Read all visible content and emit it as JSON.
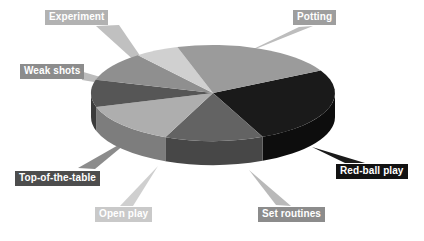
{
  "chart_data": {
    "type": "pie",
    "title": "",
    "subtitle": "",
    "xlabel": "",
    "ylabel": "",
    "legend_position": "callout-labels",
    "grid": false,
    "three_d": true,
    "categories": [
      "Red-ball play",
      "Set routines",
      "Open play",
      "Top-of-the-table",
      "Weak shots",
      "Experiment",
      "Potting"
    ],
    "values": [
      26,
      13,
      14,
      9,
      10,
      6,
      22
    ],
    "slices": [
      {
        "label": "Red-ball play",
        "value": 26,
        "color": "#1a1a1a",
        "side_color": "#0d0d0d",
        "start_angle": -28,
        "end_angle": 66
      },
      {
        "label": "Set routines",
        "value": 13,
        "color": "#636363",
        "side_color": "#474747",
        "start_angle": 66,
        "end_angle": 113
      },
      {
        "label": "Open play",
        "value": 14,
        "color": "#aeaeae",
        "side_color": "#7d7d7d",
        "start_angle": 113,
        "end_angle": 163
      },
      {
        "label": "Top-of-the-table",
        "value": 9,
        "color": "#565656",
        "side_color": "#3b3b3b",
        "start_angle": 163,
        "end_angle": 196
      },
      {
        "label": "Weak shots",
        "value": 10,
        "color": "#8f8f8f",
        "side_color": "#666666",
        "start_angle": 196,
        "end_angle": 232
      },
      {
        "label": "Experiment",
        "value": 6,
        "color": "#d0d0d0",
        "side_color": "#9a9a9a",
        "start_angle": 232,
        "end_angle": 253
      },
      {
        "label": "Potting",
        "value": 22,
        "color": "#9b9b9b",
        "side_color": "#6e6e6e",
        "start_angle": 253,
        "end_angle": 332
      }
    ]
  },
  "labels": {
    "experiment": "Experiment",
    "weak_shots": "Weak shots",
    "top_of_the_table": "Top-of-the-table",
    "open_play": "Open play",
    "set_routines": "Set routines",
    "red_ball_play": "Red-ball play",
    "potting": "Potting"
  },
  "colors": {
    "background": "#ffffff",
    "label_text": "#ffffff",
    "experiment_box": "#b2b2b2",
    "weak_shots_box": "#8c8c8c",
    "top_of_the_table_box": "#4d4d4d",
    "open_play_box": "#c9c9c9",
    "set_routines_box": "#8c8c8c",
    "red_ball_play_box": "#121212",
    "potting_box": "#9e9e9e"
  },
  "geometry": {
    "center_x": 213,
    "center_y": 93,
    "radius_x": 122,
    "radius_y": 48,
    "depth": 24
  }
}
